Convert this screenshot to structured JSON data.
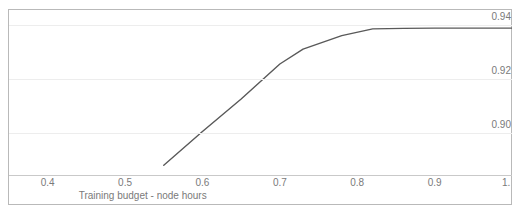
{
  "figure": {
    "clipped_title_fragment": "",
    "background_color": "#ffffff",
    "frame_color": "#b9b9b9",
    "axis_line_color": "#c9c9c9",
    "gridline_color": "#ededed",
    "tick_text_color": "#7a7a7a",
    "series_color": "#595959"
  },
  "chart_data": {
    "type": "line",
    "title": "",
    "xlabel": "Training budget - node hours",
    "ylabel": "",
    "xlim": [
      0.35,
      1.0
    ],
    "ylim": [
      0.884,
      0.9455
    ],
    "grid": true,
    "legend": false,
    "y_axis_side": "right",
    "xticks": [
      0.4,
      0.5,
      0.6,
      0.7,
      0.8,
      0.9,
      1.0
    ],
    "xticklabels": [
      "0.4",
      "0.5",
      "0.6",
      "0.7",
      "0.8",
      "0.9",
      "1."
    ],
    "yticks": [
      0.9,
      0.92,
      0.94
    ],
    "yticklabels": [
      "0.90",
      "0.92",
      "0.94"
    ],
    "series": [
      {
        "name": "accuracy",
        "color": "#595959",
        "x": [
          0.55,
          0.6,
          0.65,
          0.7,
          0.73,
          0.78,
          0.82,
          0.86,
          0.9,
          0.95,
          1.0
        ],
        "y": [
          0.888,
          0.9005,
          0.9125,
          0.9255,
          0.931,
          0.936,
          0.9385,
          0.9387,
          0.9388,
          0.9388,
          0.9388
        ]
      }
    ]
  }
}
